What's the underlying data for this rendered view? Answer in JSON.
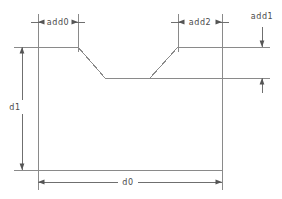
{
  "drawing": {
    "title": "Slot profile dimension drawing",
    "background_color": "#ffffff",
    "line_color": "#8a8a8a",
    "dimension_color": "#6f6f6f",
    "text_color": "#4a4a4a",
    "labels": {
      "add0": "add0",
      "add2": "add2",
      "add1": "add1",
      "d1": "d1",
      "d0": "d0"
    },
    "dimensions": [
      {
        "name": "add0",
        "label": "add0",
        "orientation": "horizontal",
        "position": "top-left",
        "from_x": 38,
        "to_x": 78,
        "line_y": 22
      },
      {
        "name": "add2",
        "label": "add2",
        "orientation": "horizontal",
        "position": "top-right",
        "from_x": 178,
        "to_x": 222,
        "line_y": 22
      },
      {
        "name": "add1",
        "label": "add1",
        "orientation": "vertical",
        "position": "right",
        "from_y": 47,
        "to_y": 78,
        "line_x": 262
      },
      {
        "name": "d1",
        "label": "d1",
        "orientation": "vertical",
        "position": "left",
        "from_y": 47,
        "to_y": 170,
        "line_x": 22
      },
      {
        "name": "d0",
        "label": "d0",
        "orientation": "horizontal",
        "position": "bottom",
        "from_x": 38,
        "to_x": 222,
        "line_y": 182
      }
    ],
    "profile": {
      "description": "Rectangular block with trapezoidal notch cut into top edge",
      "points": "38,47 78,47 105,78 150,78 178,47 222,47 222,170 38,170 38,47",
      "top_y": 47,
      "bottom_y": 170,
      "left_x": 38,
      "right_x": 222,
      "notch_bottom_y": 78,
      "notch_left_x": 105,
      "notch_right_x": 150
    }
  }
}
